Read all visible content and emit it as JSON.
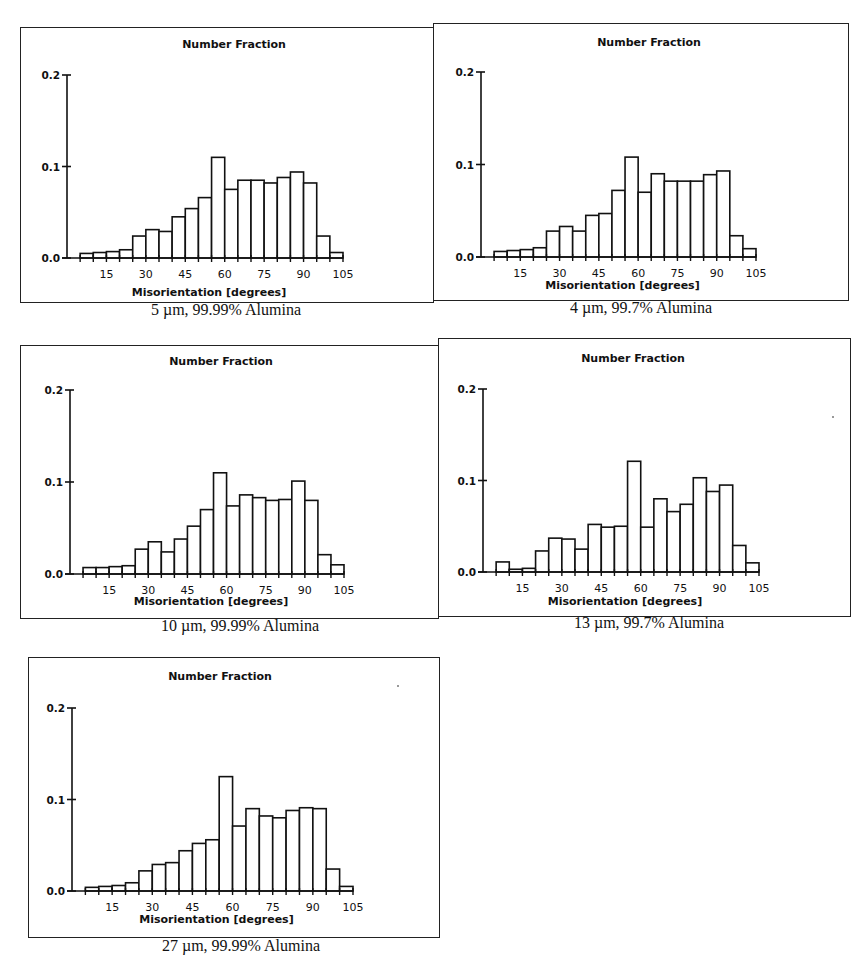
{
  "figure": {
    "panel_title": "Number Fraction",
    "x_axis_label": "Misorientation [degrees]",
    "x_ticks": [
      15,
      30,
      45,
      60,
      75,
      90,
      105
    ],
    "y_ticks": [
      "0.0",
      "0.1",
      "0.2"
    ]
  },
  "chart_data": [
    {
      "type": "bar",
      "title": "Number Fraction",
      "caption": "5 µm, 99.99% Alumina",
      "xlabel": "Misorientation [degrees]",
      "ylabel": "Number Fraction",
      "bin_width": 5,
      "categories": [
        "5-10",
        "10-15",
        "15-20",
        "20-25",
        "25-30",
        "30-35",
        "35-40",
        "40-45",
        "45-50",
        "50-55",
        "55-60",
        "60-65",
        "65-70",
        "70-75",
        "75-80",
        "80-85",
        "85-90",
        "90-95",
        "95-100",
        "100-105"
      ],
      "values": [
        0.005,
        0.006,
        0.007,
        0.009,
        0.024,
        0.031,
        0.029,
        0.045,
        0.054,
        0.066,
        0.11,
        0.075,
        0.085,
        0.085,
        0.082,
        0.088,
        0.094,
        0.082,
        0.024,
        0.006
      ],
      "xlim": [
        0,
        105
      ],
      "ylim": [
        0,
        0.2
      ],
      "x_ticks": [
        15,
        30,
        45,
        60,
        75,
        90,
        105
      ],
      "y_ticks": [
        0.0,
        0.1,
        0.2
      ],
      "grid": false,
      "legend": "none"
    },
    {
      "type": "bar",
      "title": "Number Fraction",
      "caption": "4 µm, 99.7% Alumina",
      "xlabel": "Misorientation [degrees]",
      "ylabel": "Number Fraction",
      "bin_width": 5,
      "categories": [
        "5-10",
        "10-15",
        "15-20",
        "20-25",
        "25-30",
        "30-35",
        "35-40",
        "40-45",
        "45-50",
        "50-55",
        "55-60",
        "60-65",
        "65-70",
        "70-75",
        "75-80",
        "80-85",
        "85-90",
        "90-95",
        "95-100",
        "100-105"
      ],
      "values": [
        0.006,
        0.007,
        0.008,
        0.01,
        0.028,
        0.033,
        0.028,
        0.045,
        0.047,
        0.072,
        0.108,
        0.07,
        0.09,
        0.082,
        0.082,
        0.082,
        0.089,
        0.093,
        0.023,
        0.009
      ],
      "xlim": [
        0,
        105
      ],
      "ylim": [
        0,
        0.2
      ],
      "x_ticks": [
        15,
        30,
        45,
        60,
        75,
        90,
        105
      ],
      "y_ticks": [
        0.0,
        0.1,
        0.2
      ],
      "grid": false,
      "legend": "none"
    },
    {
      "type": "bar",
      "title": "Number Fraction",
      "caption": "10 µm, 99.99% Alumina",
      "xlabel": "Misorientation [degrees]",
      "ylabel": "Number Fraction",
      "bin_width": 5,
      "categories": [
        "5-10",
        "10-15",
        "15-20",
        "20-25",
        "25-30",
        "30-35",
        "35-40",
        "40-45",
        "45-50",
        "50-55",
        "55-60",
        "60-65",
        "65-70",
        "70-75",
        "75-80",
        "80-85",
        "85-90",
        "90-95",
        "95-100",
        "100-105"
      ],
      "values": [
        0.007,
        0.007,
        0.008,
        0.009,
        0.027,
        0.035,
        0.024,
        0.038,
        0.052,
        0.07,
        0.11,
        0.074,
        0.086,
        0.083,
        0.08,
        0.081,
        0.101,
        0.08,
        0.021,
        0.01
      ],
      "xlim": [
        0,
        105
      ],
      "ylim": [
        0,
        0.2
      ],
      "x_ticks": [
        15,
        30,
        45,
        60,
        75,
        90,
        105
      ],
      "y_ticks": [
        0.0,
        0.1,
        0.2
      ],
      "grid": false,
      "legend": "none"
    },
    {
      "type": "bar",
      "title": "Number Fraction",
      "caption": "13 µm, 99.7% Alumina",
      "xlabel": "Misorientation [degrees]",
      "ylabel": "Number Fraction",
      "bin_width": 5,
      "categories": [
        "5-10",
        "10-15",
        "15-20",
        "20-25",
        "25-30",
        "30-35",
        "35-40",
        "40-45",
        "45-50",
        "50-55",
        "55-60",
        "60-65",
        "65-70",
        "70-75",
        "75-80",
        "80-85",
        "85-90",
        "90-95",
        "95-100",
        "100-105"
      ],
      "values": [
        0.011,
        0.003,
        0.004,
        0.023,
        0.037,
        0.036,
        0.025,
        0.052,
        0.049,
        0.05,
        0.121,
        0.049,
        0.08,
        0.066,
        0.074,
        0.103,
        0.088,
        0.095,
        0.029,
        0.01
      ],
      "xlim": [
        0,
        105
      ],
      "ylim": [
        0,
        0.2
      ],
      "x_ticks": [
        15,
        30,
        45,
        60,
        75,
        90,
        105
      ],
      "y_ticks": [
        0.0,
        0.1,
        0.2
      ],
      "grid": false,
      "legend": "none"
    },
    {
      "type": "bar",
      "title": "Number Fraction",
      "caption": "27 µm, 99.99% Alumina",
      "xlabel": "Misorientation [degrees]",
      "ylabel": "Number Fraction",
      "bin_width": 5,
      "categories": [
        "5-10",
        "10-15",
        "15-20",
        "20-25",
        "25-30",
        "30-35",
        "35-40",
        "40-45",
        "45-50",
        "50-55",
        "55-60",
        "60-65",
        "65-70",
        "70-75",
        "75-80",
        "80-85",
        "85-90",
        "90-95",
        "95-100",
        "100-105"
      ],
      "values": [
        0.004,
        0.005,
        0.006,
        0.009,
        0.022,
        0.029,
        0.031,
        0.044,
        0.052,
        0.056,
        0.125,
        0.071,
        0.09,
        0.082,
        0.08,
        0.088,
        0.091,
        0.09,
        0.024,
        0.005
      ],
      "xlim": [
        0,
        105
      ],
      "ylim": [
        0,
        0.2
      ],
      "x_ticks": [
        15,
        30,
        45,
        60,
        75,
        90,
        105
      ],
      "y_ticks": [
        0.0,
        0.1,
        0.2
      ],
      "grid": false,
      "legend": "none"
    }
  ]
}
